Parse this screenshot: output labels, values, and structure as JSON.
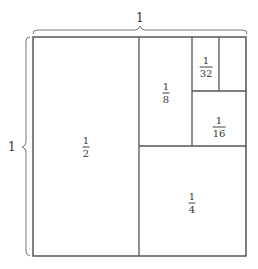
{
  "diagram": {
    "type": "area-model-geometric-series",
    "colors": {
      "stroke": "#555555",
      "background": "#ffffff",
      "text": "#333333"
    },
    "dimensions": {
      "top_label": "1",
      "left_label": "1"
    },
    "regions": [
      {
        "id": "half",
        "numerator": "1",
        "denominator": "2"
      },
      {
        "id": "quarter",
        "numerator": "1",
        "denominator": "4"
      },
      {
        "id": "eighth",
        "numerator": "1",
        "denominator": "8"
      },
      {
        "id": "sixteenth",
        "numerator": "1",
        "denominator": "16"
      },
      {
        "id": "thirtysecond",
        "numerator": "1",
        "denominator": "32"
      }
    ]
  }
}
